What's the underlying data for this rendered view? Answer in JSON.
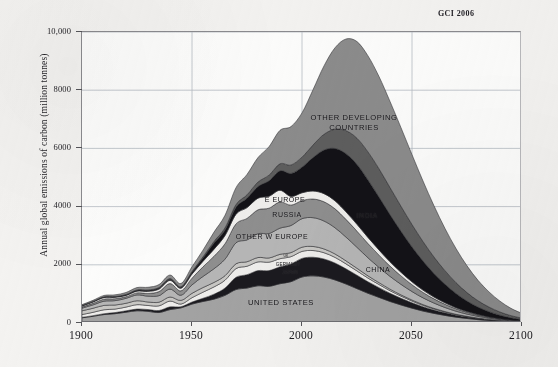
{
  "figure": {
    "credit": "GCI 2006",
    "ylabel": "Annual global emissions of carbon (million tonnes)"
  },
  "chart_data": {
    "type": "area",
    "title": "",
    "subtitle": "",
    "xlabel": "",
    "ylabel": "Annual global emissions of carbon (million tonnes)",
    "xlim": [
      1900,
      2100
    ],
    "ylim": [
      0,
      10000
    ],
    "xticks": [
      1900,
      1950,
      2000,
      2050,
      2100
    ],
    "xtick_labels": [
      "1900",
      "1950",
      "2000",
      "2050",
      "2100"
    ],
    "yticks": [
      0,
      2000,
      4000,
      6000,
      8000,
      10000
    ],
    "ytick_labels": [
      "0",
      "2000",
      "4000",
      "6000",
      "8000",
      "10,000"
    ],
    "grid": true,
    "legend": "inline-band-labels",
    "stacked": true,
    "x": [
      1900,
      1905,
      1910,
      1915,
      1920,
      1925,
      1930,
      1935,
      1940,
      1945,
      1950,
      1955,
      1960,
      1965,
      1970,
      1975,
      1980,
      1985,
      1990,
      1995,
      2000,
      2005,
      2010,
      2015,
      2020,
      2025,
      2030,
      2035,
      2040,
      2045,
      2050,
      2055,
      2060,
      2065,
      2070,
      2075,
      2080,
      2085,
      2090,
      2095,
      2100
    ],
    "series": [
      {
        "name": "UNITED STATES",
        "color": "#a3a3a3",
        "label_position": {
          "x": 2000,
          "y": 400
        },
        "values": [
          180,
          230,
          290,
          320,
          370,
          420,
          400,
          360,
          460,
          520,
          650,
          740,
          820,
          950,
          1150,
          1200,
          1280,
          1260,
          1350,
          1420,
          1580,
          1620,
          1580,
          1480,
          1340,
          1180,
          1020,
          880,
          740,
          620,
          510,
          410,
          330,
          260,
          200,
          155,
          115,
          85,
          60,
          42,
          30
        ]
      },
      {
        "name": "JAPAN",
        "color": "#1b1a1f",
        "label_position": {
          "x": 1999,
          "y": 1860
        },
        "values": [
          15,
          22,
          30,
          38,
          48,
          60,
          62,
          70,
          95,
          40,
          70,
          110,
          170,
          250,
          420,
          460,
          520,
          540,
          580,
          610,
          640,
          640,
          620,
          580,
          520,
          460,
          395,
          335,
          280,
          230,
          185,
          148,
          115,
          88,
          66,
          49,
          36,
          26,
          18,
          12,
          8
        ]
      },
      {
        "name": "GERMANY",
        "color": "#efeeec",
        "label_position": {
          "x": 1998,
          "y": 2020
        },
        "values": [
          95,
          115,
          135,
          120,
          130,
          150,
          140,
          160,
          200,
          90,
          150,
          210,
          250,
          270,
          300,
          290,
          300,
          290,
          280,
          250,
          240,
          230,
          215,
          195,
          172,
          150,
          128,
          108,
          90,
          74,
          59,
          47,
          37,
          29,
          22,
          16,
          12,
          8,
          6,
          4,
          3
        ]
      },
      {
        "name": "UK",
        "color": "#c9c8c5",
        "label_position": {
          "x": 1997,
          "y": 2170
        },
        "values": [
          130,
          140,
          150,
          140,
          130,
          135,
          120,
          125,
          140,
          125,
          150,
          160,
          155,
          155,
          165,
          155,
          150,
          145,
          150,
          140,
          145,
          140,
          130,
          118,
          104,
          90,
          77,
          64,
          53,
          43,
          35,
          28,
          21,
          16,
          12,
          9,
          6,
          4,
          3,
          2,
          1
        ]
      },
      {
        "name": "OTHER W EUROPE",
        "color": "#b7b7b7",
        "label_position": {
          "x": 1987,
          "y": 2750
        },
        "values": [
          90,
          115,
          145,
          150,
          170,
          200,
          200,
          225,
          270,
          180,
          290,
          380,
          470,
          570,
          720,
          750,
          820,
          840,
          900,
          930,
          980,
          990,
          960,
          900,
          815,
          720,
          620,
          525,
          440,
          362,
          292,
          232,
          182,
          140,
          106,
          78,
          57,
          41,
          29,
          20,
          14
        ]
      },
      {
        "name": "RUSSIA",
        "color": "#8f8f8f",
        "label_position": {
          "x": 1992,
          "y": 3820
        },
        "values": [
          40,
          55,
          70,
          65,
          55,
          70,
          95,
          140,
          190,
          150,
          230,
          330,
          430,
          530,
          650,
          740,
          820,
          870,
          900,
          700,
          620,
          640,
          660,
          650,
          610,
          555,
          490,
          420,
          352,
          290,
          234,
          186,
          145,
          112,
          84,
          62,
          45,
          32,
          22,
          15,
          10
        ]
      },
      {
        "name": "E EUROPE",
        "color": "#f0efed",
        "label_position": {
          "x": 1993,
          "y": 4280
        },
        "values": [
          35,
          45,
          55,
          50,
          45,
          60,
          70,
          85,
          110,
          90,
          140,
          190,
          240,
          280,
          330,
          370,
          400,
          410,
          400,
          300,
          270,
          275,
          280,
          275,
          258,
          235,
          208,
          178,
          150,
          123,
          100,
          79,
          62,
          48,
          36,
          26,
          19,
          14,
          10,
          6,
          4
        ]
      },
      {
        "name": "CHINA",
        "color": "#131217",
        "label_position": {
          "x": 2023,
          "y": 1500
        },
        "values": [
          10,
          12,
          15,
          18,
          22,
          28,
          32,
          35,
          40,
          30,
          60,
          110,
          210,
          190,
          240,
          320,
          400,
          530,
          670,
          790,
          880,
          1150,
          1500,
          1800,
          2000,
          2060,
          1980,
          1820,
          1620,
          1410,
          1200,
          1000,
          810,
          640,
          490,
          360,
          258,
          180,
          120,
          78,
          50
        ]
      },
      {
        "name": "INDIA",
        "color": "#5e5e5e",
        "label_position": {
          "x": 2022,
          "y": 3300
        },
        "values": [
          6,
          7,
          9,
          10,
          12,
          15,
          18,
          20,
          24,
          22,
          32,
          44,
          58,
          75,
          95,
          120,
          155,
          195,
          240,
          290,
          345,
          430,
          540,
          660,
          790,
          900,
          960,
          970,
          930,
          860,
          770,
          670,
          565,
          465,
          372,
          290,
          218,
          158,
          110,
          74,
          48
        ]
      },
      {
        "name": "OTHER DEVELOPING COUNTRIES",
        "color": "#8c8c8c",
        "label_position": {
          "x": 2016,
          "y": 7100
        },
        "values": [
          30,
          38,
          48,
          56,
          66,
          80,
          90,
          100,
          120,
          110,
          160,
          230,
          320,
          430,
          580,
          700,
          840,
          980,
          1150,
          1320,
          1520,
          1900,
          2350,
          2800,
          3150,
          3320,
          3300,
          3170,
          2960,
          2700,
          2400,
          2080,
          1760,
          1450,
          1170,
          920,
          700,
          520,
          370,
          250,
          160
        ]
      }
    ],
    "totals_note": "Stacked total peaks at roughly 9,100 million tonnes of carbon around 2015-2020, then declines to near 300 by 2100."
  },
  "band_labels": [
    {
      "text": "OTHER DEVELOPING",
      "size": "lg",
      "x": 354,
      "y": 117
    },
    {
      "text": "COUNTRIES",
      "size": "lg",
      "x": 354,
      "y": 127
    },
    {
      "text": "E EUROPE",
      "size": "md",
      "x": 285,
      "y": 199
    },
    {
      "text": "RUSSIA",
      "size": "md",
      "x": 287,
      "y": 214
    },
    {
      "text": "INDIA",
      "size": "md",
      "x": 367,
      "y": 215
    },
    {
      "text": "OTHER W EUROPE",
      "size": "md",
      "x": 272,
      "y": 236
    },
    {
      "text": "UK",
      "size": "xs",
      "x": 286,
      "y": 256
    },
    {
      "text": "GERMANY",
      "size": "sm",
      "x": 288,
      "y": 264
    },
    {
      "text": "JAPAN",
      "size": "sm",
      "x": 290,
      "y": 272
    },
    {
      "text": "CHINA",
      "size": "md",
      "x": 378,
      "y": 269
    },
    {
      "text": "UNITED STATES",
      "size": "lg",
      "x": 281,
      "y": 302
    }
  ]
}
